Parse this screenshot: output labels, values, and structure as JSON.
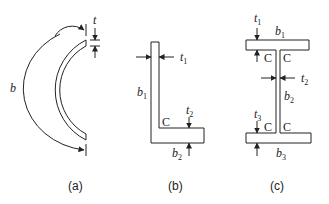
{
  "figure": {
    "panels": [
      {
        "id": "a",
        "caption": "(a)",
        "description": "thin-walled semicircular arc section",
        "labels": {
          "thickness": "t",
          "arc_length": "b"
        }
      },
      {
        "id": "b",
        "caption": "(b)",
        "description": "angle (L) section",
        "labels": {
          "t1": {
            "base": "t",
            "sub": "1"
          },
          "t2": {
            "base": "t",
            "sub": "2"
          },
          "b1": {
            "base": "b",
            "sub": "1"
          },
          "b2": {
            "base": "b",
            "sub": "2"
          },
          "corner": "C"
        }
      },
      {
        "id": "c",
        "caption": "(c)",
        "description": "I-section with unequal flanges",
        "labels": {
          "t1": {
            "base": "t",
            "sub": "1"
          },
          "t2": {
            "base": "t",
            "sub": "2"
          },
          "t3": {
            "base": "t",
            "sub": "3"
          },
          "b1": {
            "base": "b",
            "sub": "1"
          },
          "b2": {
            "base": "b",
            "sub": "2"
          },
          "b3": {
            "base": "b",
            "sub": "3"
          },
          "corner": "C"
        }
      }
    ],
    "colors": {
      "stroke": "#222222",
      "background": "#ffffff"
    }
  }
}
